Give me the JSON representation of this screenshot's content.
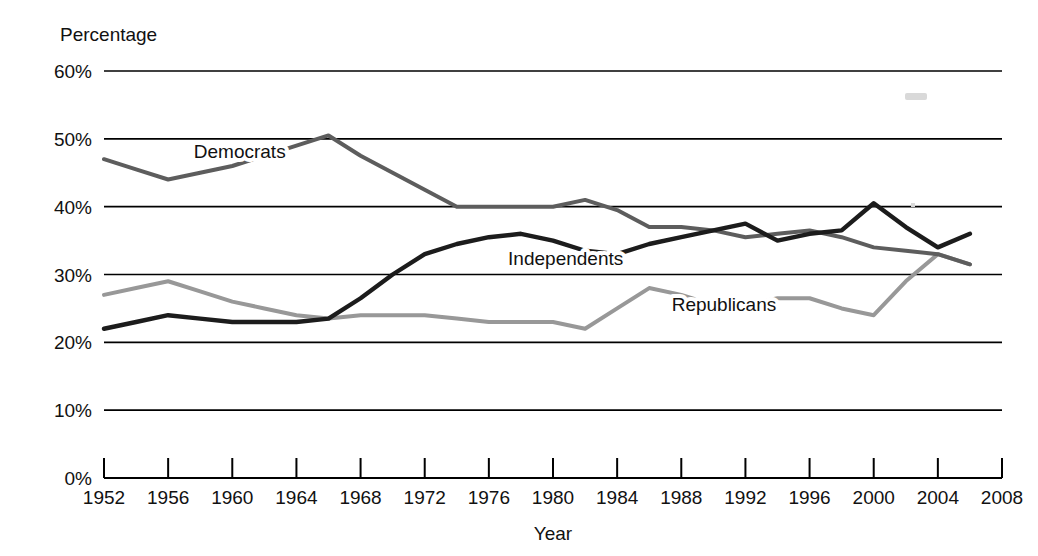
{
  "chart_data": {
    "type": "line",
    "title": "",
    "xlabel": "Year",
    "ylabel": "Percentage",
    "xlim": [
      1952,
      2008
    ],
    "ylim": [
      0,
      60
    ],
    "grid": true,
    "legend_position": "inline-labels",
    "x_tick_labels": [
      "1952",
      "1956",
      "1960",
      "1964",
      "1968",
      "1972",
      "1976",
      "1980",
      "1984",
      "1988",
      "1992",
      "1996",
      "2000",
      "2004",
      "2008"
    ],
    "y_tick_labels": [
      "0%",
      "10%",
      "20%",
      "30%",
      "40%",
      "50%",
      "60%"
    ],
    "x_ticks": [
      1952,
      1956,
      1960,
      1964,
      1968,
      1972,
      1976,
      1980,
      1984,
      1988,
      1992,
      1996,
      2000,
      2004,
      2008
    ],
    "y_ticks": [
      0,
      10,
      20,
      30,
      40,
      50,
      60
    ],
    "x": [
      1952,
      1954,
      1956,
      1958,
      1960,
      1962,
      1964,
      1966,
      1968,
      1970,
      1972,
      1974,
      1976,
      1978,
      1980,
      1982,
      1984,
      1986,
      1988,
      1990,
      1992,
      1994,
      1996,
      1998,
      2000,
      2002,
      2004,
      2006
    ],
    "series": [
      {
        "name": "Democrats",
        "color": "#5d5d5d",
        "values": [
          47.0,
          45.5,
          44.0,
          45.0,
          46.0,
          47.5,
          49.0,
          50.5,
          47.5,
          45.0,
          42.5,
          40.0,
          40.0,
          40.0,
          40.0,
          41.0,
          39.5,
          37.0,
          37.0,
          36.5,
          35.5,
          36.0,
          36.5,
          35.5,
          34.0,
          33.5,
          33.0,
          31.5
        ]
      },
      {
        "name": "Independents",
        "color": "#1c1c1c",
        "values": [
          22.0,
          23.0,
          24.0,
          23.5,
          23.0,
          23.0,
          23.0,
          23.5,
          26.5,
          30.0,
          33.0,
          34.5,
          35.5,
          36.0,
          35.0,
          33.5,
          33.0,
          34.5,
          35.5,
          36.5,
          37.5,
          35.0,
          36.0,
          36.5,
          40.5,
          37.0,
          34.0,
          36.0
        ]
      },
      {
        "name": "Republicans",
        "color": "#989898",
        "values": [
          27.0,
          28.0,
          29.0,
          27.5,
          26.0,
          25.0,
          24.0,
          23.5,
          24.0,
          24.0,
          24.0,
          23.5,
          23.0,
          23.0,
          23.0,
          22.0,
          25.0,
          28.0,
          27.0,
          25.5,
          25.5,
          26.5,
          26.5,
          25.0,
          24.0,
          29.0,
          33.0,
          31.5
        ]
      }
    ],
    "annotations": [
      {
        "name": "Democrats",
        "text": "Democrats",
        "x": 1957.6,
        "y": 47.2
      },
      {
        "name": "Independents",
        "text": "Independents",
        "x": 1977.2,
        "y": 31.4
      },
      {
        "name": "Republicans",
        "text": "Republicans",
        "x": 1987.4,
        "y": 24.6
      }
    ]
  }
}
